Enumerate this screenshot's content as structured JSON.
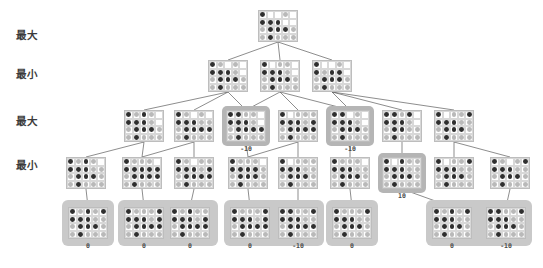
{
  "figure": {
    "background": "#ffffff",
    "dark_piece_color": "#2f2f2f",
    "light_piece_color": "#b9b9b9",
    "highlight_color": "#b5b5b5",
    "leaf_group_color": "#c9c9c9",
    "line_color": "#5c5c5c"
  },
  "row_labels": [
    {
      "text": "最大",
      "meaning": "Max",
      "x": 16,
      "y": 27
    },
    {
      "text": "最小",
      "meaning": "Min",
      "x": 16,
      "y": 66
    },
    {
      "text": "最大",
      "meaning": "Max",
      "x": 16,
      "y": 113
    },
    {
      "text": "最小",
      "meaning": "Min",
      "x": 16,
      "y": 157
    }
  ],
  "levels": [
    {
      "index": 0,
      "label": "最大",
      "y": 10,
      "node_count": 1
    },
    {
      "index": 1,
      "label": "最小",
      "y": 58,
      "node_count": 3
    },
    {
      "index": 2,
      "label": "最大",
      "y": 108,
      "node_count": 7
    },
    {
      "index": 3,
      "label": "最小",
      "y": 155,
      "node_count": 8
    },
    {
      "index": 4,
      "label": "",
      "y": 205,
      "node_count": 8
    }
  ],
  "board_geometry": {
    "cols": 5,
    "rows": 4,
    "cell": 7.4,
    "piece": 4.6
  },
  "nodes": [
    {
      "id": "n0",
      "level": 0,
      "x": 258,
      "y": 10,
      "w": 40,
      "h": 32,
      "value": null,
      "highlighted": false,
      "grid": [
        [
          "d",
          "n",
          "n",
          "l",
          "n"
        ],
        [
          "d",
          "d",
          "d",
          "n",
          "n"
        ],
        [
          "l",
          "d",
          "d",
          "d",
          "l"
        ],
        [
          "l",
          "d",
          "l",
          "l",
          "l"
        ]
      ]
    },
    {
      "id": "n1",
      "level": 1,
      "x": 208,
      "y": 60,
      "w": 40,
      "h": 32,
      "value": null,
      "highlighted": false,
      "grid": [
        [
          "d",
          "l",
          "n",
          "l",
          "n"
        ],
        [
          "d",
          "d",
          "d",
          "l",
          "n"
        ],
        [
          "l",
          "d",
          "d",
          "d",
          "l"
        ],
        [
          "l",
          "d",
          "l",
          "l",
          "l"
        ]
      ]
    },
    {
      "id": "n2",
      "level": 1,
      "x": 260,
      "y": 60,
      "w": 40,
      "h": 32,
      "value": null,
      "highlighted": false,
      "grid": [
        [
          "d",
          "n",
          "l",
          "l",
          "n"
        ],
        [
          "d",
          "d",
          "d",
          "l",
          "n"
        ],
        [
          "l",
          "d",
          "d",
          "d",
          "l"
        ],
        [
          "l",
          "d",
          "l",
          "l",
          "l"
        ]
      ]
    },
    {
      "id": "n3",
      "level": 1,
      "x": 312,
      "y": 60,
      "w": 40,
      "h": 32,
      "value": null,
      "highlighted": false,
      "grid": [
        [
          "d",
          "n",
          "n",
          "l",
          "n"
        ],
        [
          "d",
          "l",
          "d",
          "d",
          "n"
        ],
        [
          "l",
          "d",
          "d",
          "d",
          "l"
        ],
        [
          "l",
          "d",
          "l",
          "l",
          "l"
        ]
      ]
    },
    {
      "id": "n4",
      "level": 2,
      "x": 124,
      "y": 110,
      "w": 40,
      "h": 32,
      "value": null,
      "highlighted": false,
      "grid": [
        [
          "d",
          "l",
          "d",
          "l",
          "n"
        ],
        [
          "d",
          "d",
          "d",
          "l",
          "n"
        ],
        [
          "l",
          "d",
          "d",
          "d",
          "l"
        ],
        [
          "l",
          "d",
          "l",
          "l",
          "l"
        ]
      ]
    },
    {
      "id": "n5",
      "level": 2,
      "x": 174,
      "y": 110,
      "w": 40,
      "h": 32,
      "value": null,
      "highlighted": false,
      "grid": [
        [
          "d",
          "l",
          "n",
          "l",
          "n"
        ],
        [
          "d",
          "d",
          "d",
          "l",
          "l"
        ],
        [
          "l",
          "d",
          "d",
          "d",
          "d"
        ],
        [
          "l",
          "d",
          "l",
          "l",
          "l"
        ]
      ]
    },
    {
      "id": "n6",
      "level": 2,
      "x": 226,
      "y": 110,
      "w": 40,
      "h": 32,
      "value": "-10",
      "highlighted": true,
      "grid": [
        [
          "d",
          "d",
          "l",
          "l",
          "n"
        ],
        [
          "d",
          "d",
          "d",
          "l",
          "n"
        ],
        [
          "l",
          "d",
          "d",
          "d",
          "d"
        ],
        [
          "l",
          "d",
          "l",
          "l",
          "l"
        ]
      ]
    },
    {
      "id": "n7",
      "level": 2,
      "x": 278,
      "y": 110,
      "w": 40,
      "h": 32,
      "value": null,
      "highlighted": false,
      "grid": [
        [
          "d",
          "n",
          "l",
          "l",
          "l"
        ],
        [
          "d",
          "d",
          "d",
          "l",
          "d"
        ],
        [
          "l",
          "d",
          "d",
          "d",
          "d"
        ],
        [
          "l",
          "d",
          "l",
          "l",
          "l"
        ]
      ]
    },
    {
      "id": "n8",
      "level": 2,
      "x": 330,
      "y": 110,
      "w": 40,
      "h": 32,
      "value": "-10",
      "highlighted": true,
      "grid": [
        [
          "d",
          "d",
          "n",
          "l",
          "n"
        ],
        [
          "d",
          "d",
          "d",
          "l",
          "n"
        ],
        [
          "l",
          "d",
          "d",
          "d",
          "l"
        ],
        [
          "l",
          "d",
          "l",
          "l",
          "l"
        ]
      ]
    },
    {
      "id": "n9",
      "level": 2,
      "x": 382,
      "y": 110,
      "w": 40,
      "h": 32,
      "value": null,
      "highlighted": false,
      "grid": [
        [
          "d",
          "d",
          "l",
          "d",
          "n"
        ],
        [
          "d",
          "d",
          "d",
          "l",
          "n"
        ],
        [
          "l",
          "d",
          "d",
          "l",
          "l"
        ],
        [
          "l",
          "d",
          "l",
          "l",
          "l"
        ]
      ]
    },
    {
      "id": "n10",
      "level": 2,
      "x": 434,
      "y": 110,
      "w": 40,
      "h": 32,
      "value": null,
      "highlighted": false,
      "grid": [
        [
          "d",
          "n",
          "l",
          "l",
          "d"
        ],
        [
          "d",
          "d",
          "d",
          "l",
          "l"
        ],
        [
          "l",
          "d",
          "d",
          "d",
          "l"
        ],
        [
          "l",
          "d",
          "l",
          "l",
          "l"
        ]
      ]
    },
    {
      "id": "n11",
      "level": 3,
      "x": 66,
      "y": 157,
      "w": 40,
      "h": 32,
      "value": null,
      "highlighted": false,
      "grid": [
        [
          "d",
          "l",
          "d",
          "l",
          "n"
        ],
        [
          "d",
          "d",
          "d",
          "l",
          "l"
        ],
        [
          "l",
          "d",
          "d",
          "d",
          "l"
        ],
        [
          "l",
          "d",
          "l",
          "l",
          "l"
        ]
      ]
    },
    {
      "id": "n12",
      "level": 3,
      "x": 122,
      "y": 157,
      "w": 40,
      "h": 32,
      "value": null,
      "highlighted": false,
      "grid": [
        [
          "d",
          "l",
          "l",
          "l",
          "n"
        ],
        [
          "d",
          "d",
          "d",
          "d",
          "d"
        ],
        [
          "l",
          "d",
          "d",
          "d",
          "d"
        ],
        [
          "l",
          "d",
          "l",
          "l",
          "l"
        ]
      ]
    },
    {
      "id": "n13",
      "level": 3,
      "x": 174,
      "y": 157,
      "w": 40,
      "h": 32,
      "value": null,
      "highlighted": false,
      "grid": [
        [
          "d",
          "l",
          "n",
          "l",
          "l"
        ],
        [
          "d",
          "d",
          "d",
          "l",
          "d"
        ],
        [
          "l",
          "d",
          "d",
          "d",
          "d"
        ],
        [
          "l",
          "d",
          "l",
          "l",
          "l"
        ]
      ]
    },
    {
      "id": "n14",
      "level": 3,
      "x": 228,
      "y": 157,
      "w": 40,
      "h": 32,
      "value": null,
      "highlighted": false,
      "grid": [
        [
          "d",
          "l",
          "l",
          "l",
          "n"
        ],
        [
          "d",
          "d",
          "d",
          "d",
          "l"
        ],
        [
          "l",
          "d",
          "d",
          "d",
          "l"
        ],
        [
          "l",
          "d",
          "l",
          "l",
          "l"
        ]
      ]
    },
    {
      "id": "n15",
      "level": 3,
      "x": 278,
      "y": 157,
      "w": 40,
      "h": 32,
      "value": null,
      "highlighted": false,
      "grid": [
        [
          "d",
          "n",
          "l",
          "l",
          "l"
        ],
        [
          "d",
          "d",
          "d",
          "l",
          "l"
        ],
        [
          "l",
          "d",
          "d",
          "d",
          "l"
        ],
        [
          "l",
          "d",
          "l",
          "l",
          "l"
        ]
      ]
    },
    {
      "id": "n16",
      "level": 3,
      "x": 330,
      "y": 157,
      "w": 40,
      "h": 32,
      "value": null,
      "highlighted": false,
      "grid": [
        [
          "d",
          "l",
          "l",
          "l",
          "n"
        ],
        [
          "d",
          "d",
          "d",
          "l",
          "l"
        ],
        [
          "l",
          "d",
          "d",
          "d",
          "l"
        ],
        [
          "l",
          "d",
          "l",
          "l",
          "l"
        ]
      ]
    },
    {
      "id": "n17",
      "level": 3,
      "x": 382,
      "y": 157,
      "w": 40,
      "h": 32,
      "value": "10",
      "highlighted": true,
      "grid": [
        [
          "d",
          "n",
          "d",
          "l",
          "l"
        ],
        [
          "d",
          "d",
          "d",
          "l",
          "l"
        ],
        [
          "l",
          "d",
          "d",
          "d",
          "l"
        ],
        [
          "l",
          "d",
          "l",
          "l",
          "l"
        ]
      ]
    },
    {
      "id": "n18",
      "level": 3,
      "x": 434,
      "y": 157,
      "w": 40,
      "h": 32,
      "value": null,
      "highlighted": false,
      "grid": [
        [
          "d",
          "n",
          "l",
          "l",
          "d"
        ],
        [
          "d",
          "d",
          "d",
          "l",
          "l"
        ],
        [
          "l",
          "d",
          "d",
          "d",
          "l"
        ],
        [
          "l",
          "d",
          "l",
          "l",
          "l"
        ]
      ]
    },
    {
      "id": "n19",
      "level": 3,
      "x": 490,
      "y": 157,
      "w": 40,
      "h": 32,
      "value": null,
      "highlighted": false,
      "grid": [
        [
          "d",
          "l",
          "n",
          "l",
          "d"
        ],
        [
          "d",
          "d",
          "d",
          "l",
          "l"
        ],
        [
          "l",
          "d",
          "d",
          "d",
          "l"
        ],
        [
          "l",
          "d",
          "l",
          "l",
          "l"
        ]
      ]
    },
    {
      "id": "L1",
      "level": 4,
      "x": 68,
      "y": 207,
      "w": 40,
      "h": 32,
      "value": "0",
      "highlighted": false,
      "grid": [
        [
          "d",
          "l",
          "d",
          "l",
          "d"
        ],
        [
          "d",
          "d",
          "d",
          "l",
          "l"
        ],
        [
          "l",
          "d",
          "d",
          "d",
          "l"
        ],
        [
          "l",
          "d",
          "l",
          "l",
          "l"
        ]
      ]
    },
    {
      "id": "L2",
      "level": 4,
      "x": 124,
      "y": 207,
      "w": 40,
      "h": 32,
      "value": "0",
      "highlighted": false,
      "grid": [
        [
          "d",
          "l",
          "l",
          "l",
          "d"
        ],
        [
          "d",
          "d",
          "d",
          "l",
          "d"
        ],
        [
          "l",
          "d",
          "d",
          "d",
          "d"
        ],
        [
          "l",
          "d",
          "l",
          "l",
          "l"
        ]
      ]
    },
    {
      "id": "L3",
      "level": 4,
      "x": 170,
      "y": 207,
      "w": 40,
      "h": 32,
      "value": "0",
      "highlighted": false,
      "grid": [
        [
          "d",
          "l",
          "d",
          "l",
          "l"
        ],
        [
          "d",
          "d",
          "d",
          "l",
          "d"
        ],
        [
          "l",
          "d",
          "d",
          "d",
          "d"
        ],
        [
          "l",
          "d",
          "l",
          "l",
          "l"
        ]
      ]
    },
    {
      "id": "L4",
      "level": 4,
      "x": 230,
      "y": 207,
      "w": 40,
      "h": 32,
      "value": "0",
      "highlighted": false,
      "grid": [
        [
          "d",
          "l",
          "l",
          "l",
          "d"
        ],
        [
          "d",
          "d",
          "d",
          "l",
          "d"
        ],
        [
          "l",
          "d",
          "d",
          "d",
          "d"
        ],
        [
          "l",
          "d",
          "l",
          "l",
          "l"
        ]
      ]
    },
    {
      "id": "L5",
      "level": 4,
      "x": 278,
      "y": 207,
      "w": 40,
      "h": 32,
      "value": "-10",
      "highlighted": false,
      "grid": [
        [
          "d",
          "d",
          "l",
          "l",
          "d"
        ],
        [
          "d",
          "d",
          "d",
          "l",
          "l"
        ],
        [
          "l",
          "d",
          "d",
          "d",
          "d"
        ],
        [
          "l",
          "d",
          "l",
          "l",
          "l"
        ]
      ]
    },
    {
      "id": "L6",
      "level": 4,
      "x": 332,
      "y": 207,
      "w": 40,
      "h": 32,
      "value": "0",
      "highlighted": false,
      "grid": [
        [
          "d",
          "l",
          "l",
          "l",
          "d"
        ],
        [
          "d",
          "d",
          "d",
          "l",
          "l"
        ],
        [
          "l",
          "d",
          "d",
          "d",
          "l"
        ],
        [
          "l",
          "d",
          "l",
          "l",
          "l"
        ]
      ]
    },
    {
      "id": "L7",
      "level": 4,
      "x": 432,
      "y": 207,
      "w": 40,
      "h": 32,
      "value": "0",
      "highlighted": false,
      "grid": [
        [
          "d",
          "l",
          "d",
          "l",
          "d"
        ],
        [
          "d",
          "d",
          "d",
          "l",
          "l"
        ],
        [
          "l",
          "d",
          "d",
          "d",
          "l"
        ],
        [
          "l",
          "d",
          "l",
          "l",
          "l"
        ]
      ]
    },
    {
      "id": "L8",
      "level": 4,
      "x": 486,
      "y": 207,
      "w": 40,
      "h": 32,
      "value": "-10",
      "highlighted": false,
      "grid": [
        [
          "d",
          "d",
          "l",
          "l",
          "d"
        ],
        [
          "d",
          "d",
          "d",
          "l",
          "l"
        ],
        [
          "l",
          "d",
          "d",
          "d",
          "l"
        ],
        [
          "l",
          "d",
          "l",
          "l",
          "l"
        ]
      ]
    }
  ],
  "leaf_groups": [
    {
      "x": 62,
      "y": 200,
      "w": 52,
      "h": 46
    },
    {
      "x": 118,
      "y": 200,
      "w": 100,
      "h": 46
    },
    {
      "x": 224,
      "y": 200,
      "w": 100,
      "h": 46
    },
    {
      "x": 326,
      "y": 200,
      "w": 52,
      "h": 46
    },
    {
      "x": 426,
      "y": 200,
      "w": 106,
      "h": 46
    }
  ],
  "edges": [
    {
      "from": "n0",
      "to": "n1"
    },
    {
      "from": "n0",
      "to": "n2"
    },
    {
      "from": "n0",
      "to": "n3"
    },
    {
      "from": "n1",
      "to": "n4"
    },
    {
      "from": "n1",
      "to": "n5"
    },
    {
      "from": "n1",
      "to": "n6"
    },
    {
      "from": "n2",
      "to": "n6"
    },
    {
      "from": "n2",
      "to": "n7"
    },
    {
      "from": "n2",
      "to": "n8"
    },
    {
      "from": "n3",
      "to": "n8"
    },
    {
      "from": "n3",
      "to": "n9"
    },
    {
      "from": "n3",
      "to": "n10"
    },
    {
      "from": "n4",
      "to": "n11"
    },
    {
      "from": "n4",
      "to": "n12"
    },
    {
      "from": "n5",
      "to": "n12"
    },
    {
      "from": "n5",
      "to": "n13"
    },
    {
      "from": "n6",
      "to": "n14"
    },
    {
      "from": "n7",
      "to": "n14"
    },
    {
      "from": "n7",
      "to": "n15"
    },
    {
      "from": "n8",
      "to": "n16"
    },
    {
      "from": "n9",
      "to": "n17"
    },
    {
      "from": "n10",
      "to": "n18"
    },
    {
      "from": "n10",
      "to": "n19"
    },
    {
      "from": "n11",
      "to": "L1"
    },
    {
      "from": "n12",
      "to": "L2"
    },
    {
      "from": "n13",
      "to": "L3"
    },
    {
      "from": "n14",
      "to": "L4"
    },
    {
      "from": "n15",
      "to": "L5"
    },
    {
      "from": "n16",
      "to": "L6"
    },
    {
      "from": "n17",
      "to": "L7"
    },
    {
      "from": "n19",
      "to": "L8"
    }
  ],
  "chart_data": {
    "type": "table",
    "categories": [
      "L1",
      "L2",
      "L3",
      "L4",
      "L5",
      "L6",
      "L7",
      "L8"
    ],
    "values": [
      0,
      0,
      0,
      0,
      -10,
      0,
      0,
      -10
    ],
    "xlabel": "leaf node",
    "ylabel": "utility",
    "annotations": [
      {
        "node": "n6",
        "level": "最大",
        "value": "-10"
      },
      {
        "node": "n8",
        "level": "最大",
        "value": "-10"
      },
      {
        "node": "n17",
        "level": "最小",
        "value": "10"
      }
    ],
    "level_order": [
      "最大",
      "最小",
      "最大",
      "最小"
    ]
  }
}
